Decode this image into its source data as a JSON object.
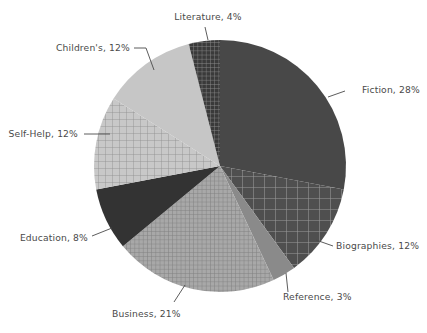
{
  "chart_data": {
    "type": "pie",
    "title": "",
    "subtitle": "",
    "xlabel": "",
    "ylabel": "",
    "legend_position": "none",
    "grid": false,
    "start_angle_deg": 0,
    "direction": "clockwise",
    "categories": [
      "Fiction",
      "Biographies",
      "Reference",
      "Business",
      "Education",
      "Self-Help",
      "Children's",
      "Literature"
    ],
    "values": [
      28,
      12,
      3,
      21,
      8,
      12,
      12,
      4
    ],
    "units": "percent",
    "slices": [
      {
        "name": "Fiction",
        "value": 28,
        "label": "Fiction, 28%",
        "color": "#484848",
        "pattern": "solid",
        "label_anchor": "start",
        "label_x": 362,
        "label_y": 93,
        "leader": "345,91 328,97"
      },
      {
        "name": "Biographies",
        "value": 12,
        "label": "Biographies, 12%",
        "color": "#4f4f4f",
        "pattern": "grid-coarse",
        "label_anchor": "start",
        "label_x": 336,
        "label_y": 249,
        "leader": "333,246 316,240"
      },
      {
        "name": "Reference",
        "value": 3,
        "label": "Reference, 3%",
        "color": "#8a8a8a",
        "pattern": "solid",
        "label_anchor": "start",
        "label_x": 283,
        "label_y": 300,
        "leader": "288,292 286,273"
      },
      {
        "name": "Business",
        "value": 21,
        "label": "Business, 21%",
        "color": "#a0a0a0",
        "pattern": "grid-fine",
        "label_anchor": "start",
        "label_x": 112,
        "label_y": 317,
        "leader": "174,302 185,285"
      },
      {
        "name": "Education",
        "value": 8,
        "label": "Education, 8%",
        "color": "#333333",
        "pattern": "solid",
        "label_anchor": "end",
        "label_x": 88,
        "label_y": 241,
        "leader": "92,236 112,228"
      },
      {
        "name": "Self-Help",
        "value": 12,
        "label": "Self-Help, 12%",
        "color": "#bdbdbd",
        "pattern": "grid-medium",
        "label_anchor": "end",
        "label_x": 78,
        "label_y": 137,
        "leader": "84,134 110,134"
      },
      {
        "name": "Children's",
        "value": 12,
        "label": "Children's, 12%",
        "color": "#c6c6c6",
        "pattern": "solid",
        "label_anchor": "end",
        "label_x": 130,
        "label_y": 51,
        "leader": "134,48 146,48 154,70"
      },
      {
        "name": "Literature",
        "value": 4,
        "label": "Literature, 4%",
        "color": "#3f3f3f",
        "pattern": "grid-fine-dark",
        "label_anchor": "middle",
        "label_x": 208,
        "label_y": 20,
        "leader": "205,27 208,40"
      }
    ],
    "geometry": {
      "center_x": 220,
      "center_y": 166,
      "radius": 126
    },
    "background_color": "#ffffff",
    "text_color": "#4a4a4a"
  }
}
